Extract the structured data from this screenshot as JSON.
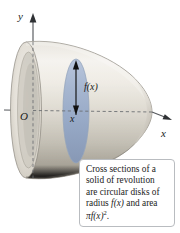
{
  "figure": {
    "background_color": "#ffffff"
  },
  "axes": {
    "y_label": "y",
    "x_label": "x",
    "origin_label": "O",
    "axis_color": "#55585c",
    "dashed_color": "#6b6e72"
  },
  "annotations": {
    "radius_label": "f(x)",
    "x_position_label": "x",
    "arrow_color": "#111111"
  },
  "solid": {
    "body_color_light": "#f2f0ec",
    "body_color_mid": "#d8d4cb",
    "body_color_dark": "#9a958a",
    "outline_color": "#8d8880",
    "disk_color": "#9fb0cb",
    "disk_edge_color": "#7d90ae"
  },
  "caption": {
    "line1": "Cross sections of a",
    "line2": "solid of revolution",
    "line3": "are circular disks of",
    "line4_pre": "radius ",
    "line4_math": "f(x)",
    "line4_post": " and area",
    "line5_pi": "π",
    "line5_math": "f(x)",
    "line5_sup": "2",
    "line5_post": ".",
    "border_color": "#b9bcc0"
  }
}
